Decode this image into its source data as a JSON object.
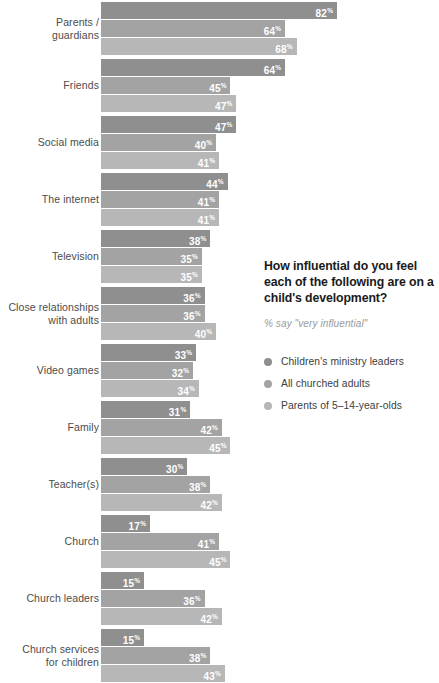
{
  "chart_data": {
    "type": "bar",
    "orientation": "horizontal",
    "title": "How influential do you feel each of the following are on a child's development?",
    "subtitle": "% say \"very influential\"",
    "xlabel": "",
    "ylabel": "",
    "xlim": [
      0,
      100
    ],
    "grid": false,
    "legend_position": "right",
    "value_suffix": "%",
    "categories": [
      "Parents / guardians",
      "Friends",
      "Social media",
      "The internet",
      "Television",
      "Close relationships with adults",
      "Video games",
      "Family",
      "Teacher(s)",
      "Church",
      "Church leaders",
      "Church services for children"
    ],
    "category_lines": [
      [
        "Parents /",
        "guardians"
      ],
      [
        "Friends"
      ],
      [
        "Social media"
      ],
      [
        "The internet"
      ],
      [
        "Television"
      ],
      [
        "Close relationships",
        "with adults"
      ],
      [
        "Video games"
      ],
      [
        "Family"
      ],
      [
        "Teacher(s)"
      ],
      [
        "Church"
      ],
      [
        "Church leaders"
      ],
      [
        "Church services",
        "for children"
      ]
    ],
    "series": [
      {
        "name": "Children's ministry leaders",
        "color": "#8f8f8f",
        "values": [
          82,
          64,
          47,
          44,
          38,
          36,
          33,
          31,
          30,
          17,
          15,
          15
        ]
      },
      {
        "name": "All churched adults",
        "color": "#a3a3a3",
        "values": [
          64,
          45,
          40,
          41,
          35,
          36,
          32,
          42,
          38,
          41,
          36,
          38
        ]
      },
      {
        "name": "Parents of 5–14-year-olds",
        "color": "#b7b7b7",
        "values": [
          68,
          47,
          41,
          41,
          35,
          40,
          34,
          45,
          42,
          45,
          42,
          43
        ]
      }
    ]
  },
  "legend": {
    "items": [
      {
        "label": "Children's ministry leaders",
        "color": "#8f8f8f"
      },
      {
        "label": "All churched adults",
        "color": "#a3a3a3"
      },
      {
        "label": "Parents of 5–14-year-olds",
        "color": "#b7b7b7"
      }
    ]
  },
  "colors": {
    "series_dark": "#8f8f8f",
    "series_mid": "#a3a3a3",
    "series_light": "#b7b7b7",
    "label_text": "#4b4b4b",
    "title_text": "#1a1a1a",
    "subtitle_text": "#9a9a9a",
    "value_text": "#ffffff",
    "background": "#ffffff"
  }
}
